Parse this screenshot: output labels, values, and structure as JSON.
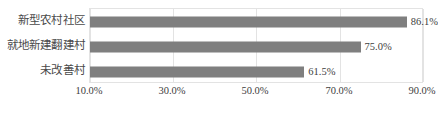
{
  "chart_data": {
    "type": "bar",
    "orientation": "horizontal",
    "title": "",
    "xlabel": "",
    "ylabel": "",
    "categories": [
      "新型农村社区",
      "就地新建翻建村",
      "未改善村"
    ],
    "values": [
      86.1,
      75.0,
      61.5
    ],
    "value_labels": [
      "86.1%",
      "75.0%",
      "61.5%"
    ],
    "xlim": [
      10,
      90
    ],
    "xticks": [
      10,
      30,
      50,
      70,
      90
    ],
    "xtick_labels": [
      "10.0%",
      "30.0%",
      "50.0%",
      "70.0%",
      "90.0%"
    ],
    "grid": "vertical",
    "legend": "none",
    "bar_color": "#7f7f7f",
    "gridline_color": "#e3e3e3",
    "plot_border_color": "#e3e3e3",
    "text_color": "#3d3d3d"
  }
}
